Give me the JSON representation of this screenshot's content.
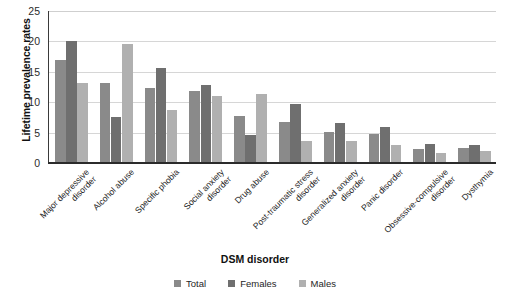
{
  "chart_data": {
    "type": "bar",
    "title": "",
    "xlabel": "DSM disorder",
    "ylabel": "Lifetime prevalence rates",
    "ylim": [
      0,
      25
    ],
    "yticks": [
      0,
      5,
      10,
      15,
      20,
      25
    ],
    "grid": true,
    "legend_position": "bottom",
    "categories": [
      "Major depressive disorder",
      "Alcohol abuse",
      "Specific phobia",
      "Social anxiety disorder",
      "Drug abuse",
      "Post-traumatic stress disorder",
      "Generalized anxiety disorder",
      "Panic disorder",
      "Obsessive-compulsive disorder",
      "Dysthymia"
    ],
    "category_lines": [
      [
        "Major depressive",
        "disorder"
      ],
      [
        "Alcohol abuse"
      ],
      [
        "Specific phobia"
      ],
      [
        "Social anxiety",
        "disorder"
      ],
      [
        "Drug abuse"
      ],
      [
        "Post-traumatic stress",
        "disorder"
      ],
      [
        "Generalized anxiety",
        "disorder"
      ],
      [
        "Panic disorder"
      ],
      [
        "Obsessive-compulsive",
        "disorder"
      ],
      [
        "Dysthymia"
      ]
    ],
    "series": [
      {
        "name": "Total",
        "color": "#8a8a8a",
        "values": [
          16.9,
          13.2,
          12.4,
          11.9,
          7.8,
          6.8,
          5.1,
          4.7,
          2.3,
          2.5
        ]
      },
      {
        "name": "Females",
        "color": "#6f6f6f",
        "values": [
          20.1,
          7.5,
          15.7,
          12.9,
          4.6,
          9.7,
          6.6,
          5.9,
          3.1,
          3.0
        ]
      },
      {
        "name": "Males",
        "color": "#b0b0b0",
        "values": [
          13.2,
          19.5,
          8.8,
          11.0,
          11.3,
          3.6,
          3.6,
          3.0,
          1.6,
          2.0
        ]
      }
    ]
  },
  "legend": {
    "items": [
      {
        "label": "Total",
        "key": "total"
      },
      {
        "label": "Females",
        "key": "females"
      },
      {
        "label": "Males",
        "key": "males"
      }
    ]
  }
}
